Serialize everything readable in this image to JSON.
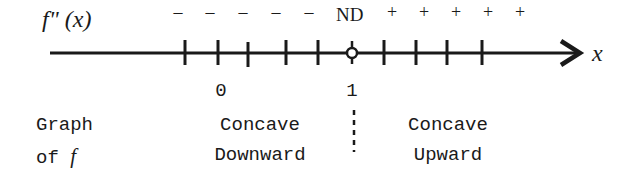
{
  "function_label": "f\" (x)",
  "axis": {
    "variable": "x",
    "critical_labels": [
      {
        "text": "0",
        "x": 221
      },
      {
        "text": "1",
        "x": 352
      }
    ],
    "tick_x": [
      185,
      218,
      248,
      286,
      318,
      384,
      416,
      447,
      482
    ],
    "discontinuity_x": 352
  },
  "signs": {
    "negative": [
      "-",
      "-",
      "-",
      "-",
      "-"
    ],
    "negative_x": [
      178,
      210,
      243,
      276,
      309
    ],
    "nd_label": "ND",
    "positive": [
      "+",
      "+",
      "+",
      "+",
      "+"
    ],
    "positive_x": [
      392,
      424,
      456,
      488,
      520
    ]
  },
  "graph_label": {
    "line1": "Graph",
    "line2_prefix": "of ",
    "line2_var": "f"
  },
  "intervals": [
    {
      "line1": "Concave",
      "line2": "Downward"
    },
    {
      "line1": "Concave",
      "line2": "Upward"
    }
  ],
  "colors": {
    "ink": "#1a1a1a",
    "background": "#ffffff"
  }
}
